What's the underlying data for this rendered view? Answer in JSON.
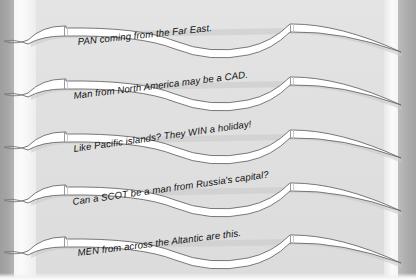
{
  "page": {
    "background_color": "#e2e2e2",
    "ribbon_fill_color": "#ffffff",
    "ribbon_outline_color": "#6a6a6a",
    "text_color": "#111111",
    "margin_color": "#a6a6a6"
  },
  "ribbons": [
    {
      "index": 1,
      "text": "PAN coming from the Far East.",
      "name": "ribbon-clue-1"
    },
    {
      "index": 2,
      "text": "Man from North America may be a CAD.",
      "name": "ribbon-clue-2"
    },
    {
      "index": 3,
      "text": "Like Pacific islands? They WIN a holiday!",
      "name": "ribbon-clue-3"
    },
    {
      "index": 4,
      "text": "Can a SCOT be a man from Russia's capital?",
      "name": "ribbon-clue-4"
    },
    {
      "index": 5,
      "text": "MEN from across the Altantic are this.",
      "name": "ribbon-clue-5"
    }
  ]
}
